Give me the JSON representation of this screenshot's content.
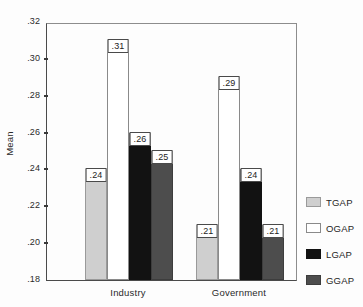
{
  "chart_data": {
    "type": "bar",
    "title": "",
    "xlabel": "",
    "ylabel": "Mean",
    "ylim": [
      0.18,
      0.32
    ],
    "yticks": [
      ".18",
      ".20",
      ".22",
      ".24",
      ".26",
      ".28",
      ".30",
      ".32"
    ],
    "ytick_values": [
      0.18,
      0.2,
      0.22,
      0.24,
      0.26,
      0.28,
      0.3,
      0.32
    ],
    "grid": false,
    "legend_position": "right",
    "categories": [
      "Industry",
      "Government"
    ],
    "series": [
      {
        "name": "TGAP",
        "color": "#cfcfcf",
        "values": [
          0.24,
          0.21
        ],
        "labels": [
          ".24",
          ".21"
        ]
      },
      {
        "name": "OGAP",
        "color": "#ffffff",
        "values": [
          0.31,
          0.29
        ],
        "labels": [
          ".31",
          ".29"
        ]
      },
      {
        "name": "LGAP",
        "color": "#121212",
        "values": [
          0.26,
          0.24
        ],
        "labels": [
          ".26",
          ".24"
        ]
      },
      {
        "name": "GGAP",
        "color": "#4d4d4d",
        "values": [
          0.25,
          0.21
        ],
        "labels": [
          ".25",
          ".21"
        ]
      }
    ]
  }
}
